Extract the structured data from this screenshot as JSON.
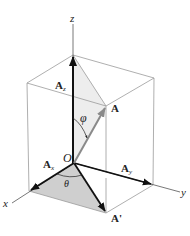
{
  "figure": {
    "type": "3d-vector-components",
    "labels": {
      "z_axis": "z",
      "x_axis": "x",
      "y_axis": "y",
      "origin": "O",
      "vector": "A",
      "vector_z": "A",
      "vector_z_sub": "z",
      "vector_x": "A",
      "vector_x_sub": "x",
      "vector_y": "A",
      "vector_y_sub": "y",
      "projection": "A'",
      "angle_phi": "φ",
      "angle_theta": "θ"
    },
    "colors": {
      "axis": "#555555",
      "box_edge": "#9a9a9a",
      "vector_dark": "#111111",
      "vector_gray": "#8a8a8a",
      "shade_light": "#ececec",
      "shade_dark": "#c9c9c9"
    }
  }
}
